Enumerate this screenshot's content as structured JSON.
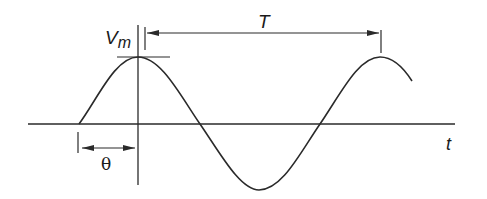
{
  "diagram": {
    "labels": {
      "amplitude": "V",
      "amplitude_sub": "m",
      "period": "T",
      "phase": "θ",
      "time_axis": "t"
    },
    "colors": {
      "stroke": "#2a2a2a",
      "background": "#ffffff"
    },
    "waveform": {
      "type": "sine",
      "phase_shift_label": "θ",
      "cycles_shown": 1.25
    }
  }
}
